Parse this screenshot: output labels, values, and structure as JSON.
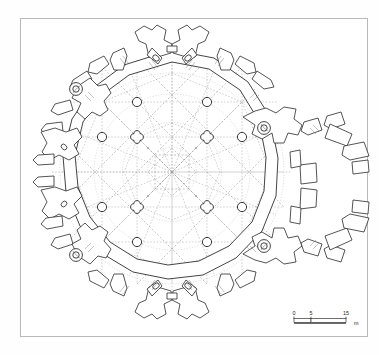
{
  "figure": {
    "kind": "architectural-floor-plan",
    "line_color": "#222222",
    "rib_color": "#a8a8a8",
    "frame_color": "#b9b9b9",
    "background_color": "#ffffff"
  },
  "scale_bar": {
    "name": "scale-bar",
    "ticks": [
      "0",
      "5",
      "15"
    ],
    "tick_values": [
      0,
      5,
      15
    ],
    "unit_label": "m",
    "segments": 2
  },
  "plan": {
    "center": {
      "x": 172,
      "y": 172
    },
    "outer_radius": 132,
    "wall_inner_radius": 112,
    "wall_outer_radius": 122,
    "bays": 16,
    "pier_grid_spacing": 35,
    "piers": {
      "circle_label": "circular-pier",
      "quatrefoil_label": "quatrefoil-pier",
      "circle_radius": 4.6,
      "quatrefoil_radius": 6.2,
      "positions": [
        {
          "x": -35,
          "y": -70,
          "type": "circle"
        },
        {
          "x": 35,
          "y": -70,
          "type": "circle"
        },
        {
          "x": -70,
          "y": -35,
          "type": "circle"
        },
        {
          "x": -35,
          "y": -35,
          "type": "quat"
        },
        {
          "x": 35,
          "y": -35,
          "type": "quat"
        },
        {
          "x": 70,
          "y": -35,
          "type": "circle"
        },
        {
          "x": -70,
          "y": 35,
          "type": "circle"
        },
        {
          "x": -35,
          "y": 35,
          "type": "quat"
        },
        {
          "x": 35,
          "y": 35,
          "type": "quat"
        },
        {
          "x": 70,
          "y": 35,
          "type": "circle"
        },
        {
          "x": -35,
          "y": 70,
          "type": "circle"
        },
        {
          "x": 35,
          "y": 70,
          "type": "circle"
        }
      ]
    },
    "stair_turrets": {
      "name": "spiral-stair-turret",
      "count": 4,
      "angles_deg": [
        218,
        320,
        40,
        140
      ],
      "radius": 126,
      "marker_outer_r": 6.5,
      "marker_inner_r": 3.2
    },
    "chapels": {
      "name": "radiating-chapel",
      "major_angles_deg": [
        270,
        90,
        0,
        180
      ],
      "count": 8
    },
    "buttresses": {
      "name": "external-buttress",
      "count": 16
    }
  }
}
